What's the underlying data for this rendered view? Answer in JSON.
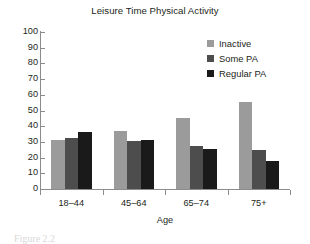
{
  "chart_data": {
    "type": "bar",
    "title": "Leisure Time Physical Activity",
    "xlabel": "Age",
    "ylabel": "",
    "ylim": [
      0,
      100
    ],
    "ytick_step": 10,
    "grid": false,
    "legend_position": "top-right",
    "categories": [
      "18–44",
      "45–64",
      "65–74",
      "75+"
    ],
    "yticks": [
      "100",
      "90",
      "80",
      "70",
      "60",
      "50",
      "40",
      "30",
      "20",
      "10",
      "0"
    ],
    "ytick_values": [
      100,
      90,
      80,
      70,
      60,
      50,
      40,
      30,
      20,
      10,
      0
    ],
    "series": [
      {
        "name": "Inactive",
        "color": "#9b9b9b",
        "values": [
          31,
          37,
          45.5,
          55.5
        ]
      },
      {
        "name": "Some PA",
        "color": "#4d4d4d",
        "values": [
          32.5,
          30.5,
          27.5,
          25
        ]
      },
      {
        "name": "Regular PA",
        "color": "#1a1a1a",
        "values": [
          36,
          31.5,
          25.5,
          18
        ]
      }
    ]
  },
  "legend": {
    "items": [
      {
        "label": "Inactive",
        "color": "#9b9b9b"
      },
      {
        "label": "Some PA",
        "color": "#4d4d4d"
      },
      {
        "label": "Regular PA",
        "color": "#1a1a1a"
      }
    ]
  },
  "caption": {
    "fragment": "Figure 2.2"
  },
  "colors": {
    "axis": "#8c8c8c",
    "text": "#231f20",
    "background": "#ffffff"
  }
}
